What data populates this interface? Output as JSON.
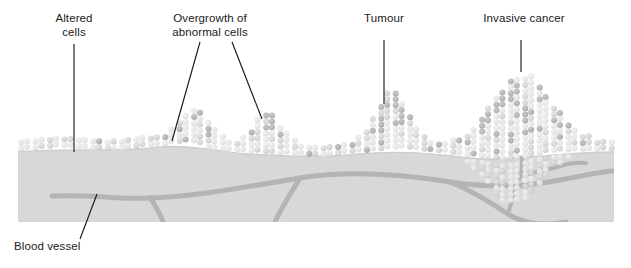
{
  "diagram": {
    "labels": {
      "altered_cells": "Altered\ncells",
      "overgrowth": "Overgrowth of\nabnormal cells",
      "tumour": "Tumour",
      "invasive_cancer": "Invasive cancer",
      "blood_vessel": "Blood vessel"
    },
    "colors": {
      "background": "#ffffff",
      "text": "#1a1a1a",
      "leader_line": "#1a1a1a",
      "tissue_fill": "#d6d6d6",
      "tissue_edge": "#c9c9c9",
      "vessel": "#b0b0b0",
      "cell_light": "#e2e2e2",
      "cell_mid": "#d0d0d0",
      "cell_dark": "#a8a8a8"
    },
    "stages": [
      {
        "name": "altered-cells",
        "label": "Altered\ncells",
        "description": "Flat epithelial layer with a few scattered darker altered cells",
        "leader": {
          "type": "straight",
          "x1": 74,
          "y1": 44,
          "x2": 74,
          "y2": 152
        }
      },
      {
        "name": "overgrowth-of-abnormal-cells",
        "label": "Overgrowth of\nabnormal cells",
        "description": "Two low mounds where abnormal cells pile above the basement membrane",
        "leader": {
          "type": "forked",
          "lines": [
            {
              "x1": 200,
              "y1": 42,
              "x2": 172,
              "y2": 140
            },
            {
              "x1": 232,
              "y1": 42,
              "x2": 262,
              "y2": 118
            }
          ]
        }
      },
      {
        "name": "tumour",
        "label": "Tumour",
        "description": "Large triangular mound of densely packed cells confined above the membrane",
        "leader": {
          "type": "straight",
          "x1": 384,
          "y1": 40,
          "x2": 384,
          "y2": 104
        }
      },
      {
        "name": "invasive-cancer",
        "label": "Invasive cancer",
        "description": "Largest mass of cells breaking through the basement membrane into tissue below",
        "leader": {
          "type": "straight",
          "x1": 521,
          "y1": 40,
          "x2": 521,
          "y2": 72
        }
      },
      {
        "name": "blood-vessel",
        "label": "Blood vessel",
        "description": "Network of vessels in the connective tissue, branching toward the invasive tumour",
        "leader": {
          "type": "straight",
          "x1": 96,
          "y1": 195,
          "x2": 80,
          "y2": 238
        }
      }
    ],
    "tissue": {
      "left": 18,
      "right": 614,
      "bottom": 222,
      "surface_note": "Undulating basement membrane following the cell layer"
    }
  }
}
